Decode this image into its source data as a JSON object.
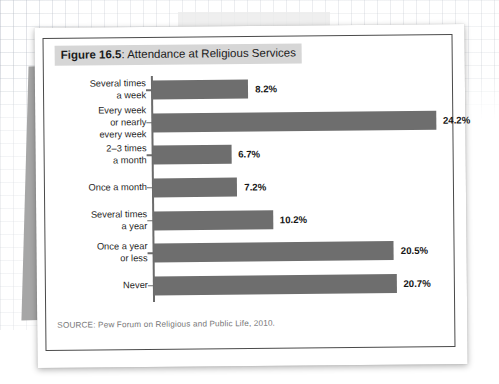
{
  "figure": {
    "number_label": "Figure 16.5",
    "title_rest": ": Attendance at Religious Services",
    "source": "SOURCE: Pew Forum on Religious and Public Life, 2010."
  },
  "colors": {
    "bar": "#6e6e6e",
    "axis": "#6b6b6b",
    "title_band": "#d6d6d6",
    "frame_border": "#4a4a4a",
    "source_text": "#777777",
    "page": "#ffffff"
  },
  "chart_data": {
    "type": "bar",
    "orientation": "horizontal",
    "title": "Figure 16.5: Attendance at Religious Services",
    "xlabel": "",
    "ylabel": "",
    "grid": false,
    "legend": "none",
    "value_suffix": "%",
    "xlim": [
      0,
      25
    ],
    "categories": [
      "Several times\na week",
      "Every week\nor nearly\nevery week",
      "2–3 times\na month",
      "Once a month",
      "Several times\na year",
      "Once a year\nor less",
      "Never"
    ],
    "values": [
      8.2,
      24.2,
      6.7,
      7.2,
      10.2,
      20.5,
      20.7
    ],
    "value_labels": [
      "8.2%",
      "24.2%",
      "6.7%",
      "7.2%",
      "10.2%",
      "20.5%",
      "20.7%"
    ],
    "source": "SOURCE: Pew Forum on Religious and Public Life, 2010."
  }
}
